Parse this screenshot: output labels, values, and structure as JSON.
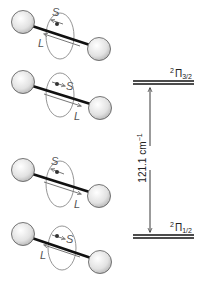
{
  "diagram": {
    "molecules": [
      {
        "id": "row1",
        "state": "2Pi3/2",
        "spin_label": "S",
        "orbit_label": "L",
        "spin_direction": "left",
        "orbit_direction": "left"
      },
      {
        "id": "row2",
        "state": "2Pi3/2",
        "spin_label": "S",
        "orbit_label": "L",
        "spin_direction": "right",
        "orbit_direction": "right"
      },
      {
        "id": "row3",
        "state": "2Pi1/2",
        "spin_label": "S",
        "orbit_label": "L",
        "spin_direction": "left",
        "orbit_direction": "right"
      },
      {
        "id": "row4",
        "state": "2Pi1/2",
        "spin_label": "S",
        "orbit_label": "L",
        "spin_direction": "right",
        "orbit_direction": "left"
      }
    ],
    "levels": {
      "upper": {
        "superscript": "2",
        "symbol": "Π",
        "subscript": "3/2"
      },
      "lower": {
        "superscript": "2",
        "symbol": "Π",
        "subscript": "1/2"
      }
    },
    "splitting": {
      "value": "121.1",
      "unit": "cm",
      "unit_exponent": "−1"
    },
    "colors": {
      "sphere_fill": "#e6e6e6",
      "sphere_stroke": "#555555",
      "bond": "#111111",
      "vector": "#777777",
      "level": "#111111"
    }
  }
}
